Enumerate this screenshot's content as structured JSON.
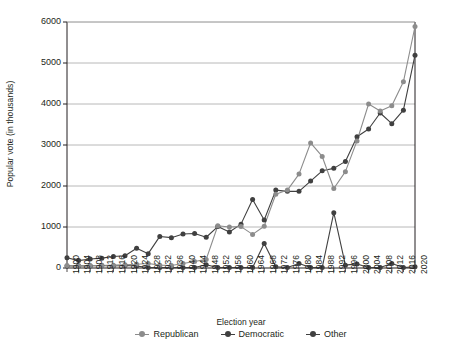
{
  "chart_data": {
    "type": "line",
    "title": "",
    "xlabel": "Election year",
    "ylabel": "Popular vote (in thousands)",
    "ylim": [
      0,
      6000
    ],
    "yticks": [
      0,
      1000,
      2000,
      3000,
      4000,
      5000,
      6000
    ],
    "ytick_labels": [
      "0",
      "1000",
      "2000",
      "3000",
      "4000",
      "5000",
      "6000"
    ],
    "grid": "horizontal",
    "legend_position": "bottom",
    "categories": [
      1900,
      1904,
      1908,
      1912,
      1916,
      1920,
      1924,
      1928,
      1932,
      1936,
      1940,
      1944,
      1948,
      1952,
      1956,
      1960,
      1964,
      1968,
      1972,
      1976,
      1980,
      1984,
      1988,
      1992,
      1996,
      2000,
      2004,
      2008,
      2012,
      2016,
      2020
    ],
    "xtick_labels": [
      "1900",
      "1904",
      "1908",
      "1912",
      "1916",
      "1920",
      "1924",
      "1928",
      "1932",
      "1936",
      "1940",
      "1944",
      "1948",
      "1952",
      "1956",
      "1960",
      "1964",
      "1968",
      "1972",
      "1976",
      "1980",
      "1984",
      "1988",
      "1992",
      "1996",
      "2000",
      "2004",
      "2008",
      "2012",
      "2016",
      "2020"
    ],
    "series": [
      {
        "name": "Republican",
        "color": "#8c8c8c",
        "values": [
          60,
          60,
          60,
          60,
          70,
          80,
          90,
          110,
          70,
          60,
          110,
          160,
          210,
          1030,
          1000,
          1010,
          820,
          1020,
          1800,
          1900,
          2290,
          3050,
          2720,
          1940,
          2350,
          3100,
          4000,
          3830,
          3960,
          4540,
          5890
        ]
      },
      {
        "name": "Democratic",
        "color": "#404040",
        "values": [
          250,
          180,
          220,
          240,
          280,
          300,
          480,
          350,
          770,
          740,
          830,
          840,
          750,
          1010,
          880,
          1070,
          1670,
          1170,
          1900,
          1870,
          1870,
          2120,
          2370,
          2430,
          2600,
          3200,
          3390,
          3780,
          3520,
          3850,
          5190
        ]
      },
      {
        "name": "Other",
        "color": "#404040",
        "values": [
          50,
          50,
          50,
          60,
          50,
          60,
          50,
          10,
          10,
          10,
          10,
          10,
          80,
          10,
          10,
          10,
          10,
          600,
          30,
          10,
          110,
          10,
          10,
          1350,
          70,
          100,
          10,
          10,
          110,
          10,
          30
        ]
      }
    ]
  },
  "axes": {
    "x_title": "Election year",
    "y_title": "Popular vote (in thousands)"
  },
  "legend": {
    "items": [
      {
        "label": "Republican",
        "color": "#8c8c8c"
      },
      {
        "label": "Democratic",
        "color": "#404040"
      },
      {
        "label": "Other",
        "color": "#404040"
      }
    ]
  }
}
